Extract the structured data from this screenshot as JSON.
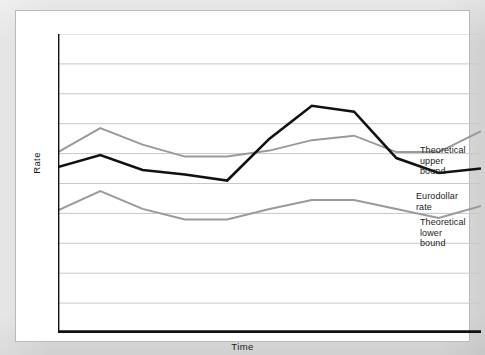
{
  "figure": {
    "background_color": "#ffffff",
    "page_color": "#dcdcdc",
    "border_color": "#333333"
  },
  "axes": {
    "y_label": "Rate",
    "x_label": "Time",
    "gridline_color": "#c8c8c8",
    "axis_color": "#111111",
    "gridline_count": 10
  },
  "labels": {
    "upper": "Theoretical\nupper bound",
    "euro": "Eurodollar rate",
    "lower": "Theoretical\nlower bound"
  },
  "chart_data": {
    "type": "line",
    "title": "",
    "xlabel": "Time",
    "ylabel": "Rate",
    "xlim": [
      0,
      10
    ],
    "ylim": [
      0,
      10
    ],
    "grid": true,
    "legend_position": "inline-right",
    "x": [
      0,
      1,
      2,
      3,
      4,
      5,
      6,
      7,
      8,
      9,
      10
    ],
    "series": [
      {
        "name": "Theoretical upper bound",
        "color": "#9a9a9a",
        "width": 2.0,
        "values": [
          6.05,
          6.85,
          6.3,
          5.9,
          5.9,
          6.1,
          6.45,
          6.6,
          6.05,
          6.05,
          6.75
        ]
      },
      {
        "name": "Eurodollar rate",
        "color": "#111111",
        "width": 2.6,
        "values": [
          5.55,
          5.95,
          5.45,
          5.3,
          5.1,
          6.5,
          7.6,
          7.4,
          5.85,
          5.35,
          5.5
        ]
      },
      {
        "name": "Theoretical lower bound",
        "color": "#9a9a9a",
        "width": 2.0,
        "values": [
          4.1,
          4.75,
          4.15,
          3.8,
          3.8,
          4.15,
          4.45,
          4.45,
          4.15,
          3.85,
          4.25
        ]
      }
    ]
  }
}
